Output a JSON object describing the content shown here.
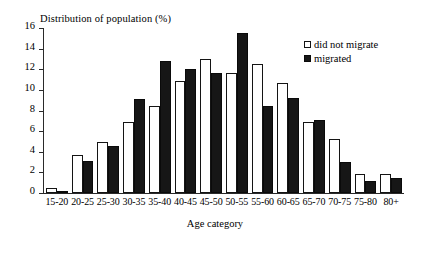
{
  "chart_data": {
    "type": "bar",
    "title": "",
    "ylabel": "Distribution of population (%)",
    "xlabel": "Age category",
    "ylim": [
      0,
      16
    ],
    "yticks": [
      0,
      2,
      4,
      6,
      8,
      10,
      12,
      14,
      16
    ],
    "grid": false,
    "legend_position": "top-right",
    "categories": [
      "15-20",
      "20-25",
      "25-30",
      "30-35",
      "35-40",
      "40-45",
      "45-50",
      "50-55",
      "55-60",
      "60-65",
      "65-70",
      "70-75",
      "75-80",
      "80+"
    ],
    "series": [
      {
        "name": "did not migrate",
        "fill": "#ffffff",
        "values": [
          0.5,
          3.7,
          4.9,
          6.9,
          8.4,
          10.9,
          13.0,
          11.6,
          12.5,
          10.7,
          6.9,
          5.2,
          1.8,
          1.8
        ]
      },
      {
        "name": "migrated",
        "fill": "#161616",
        "values": [
          0.2,
          3.1,
          4.6,
          9.1,
          12.8,
          12.0,
          11.6,
          15.5,
          8.4,
          9.2,
          7.1,
          3.0,
          1.2,
          1.5
        ]
      }
    ]
  },
  "legend": {
    "items": [
      {
        "label": "did not migrate",
        "style": "white"
      },
      {
        "label": "migrated",
        "style": "black"
      }
    ]
  },
  "colors": {
    "axis": "#2a2a2a",
    "bar_outline": "#141414",
    "bar_fill_migrated": "#161616",
    "background": "#ffffff"
  }
}
